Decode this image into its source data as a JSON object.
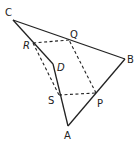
{
  "diagram": {
    "type": "geometry-quadrilateral",
    "vertices": {
      "A": {
        "label": "A",
        "x": 68,
        "y": 126
      },
      "B": {
        "label": "B",
        "x": 125,
        "y": 59
      },
      "C": {
        "label": "C",
        "x": 13,
        "y": 20
      },
      "D": {
        "label": "D",
        "x": 53,
        "y": 64
      }
    },
    "midpoints": {
      "P": {
        "label": "P",
        "x": 96,
        "y": 93
      },
      "Q": {
        "label": "Q",
        "x": 69,
        "y": 40
      },
      "R": {
        "label": "R",
        "x": 33,
        "y": 43
      },
      "S": {
        "label": "S",
        "x": 59,
        "y": 95
      }
    },
    "solid_edges": [
      [
        "A",
        "B"
      ],
      [
        "B",
        "C"
      ],
      [
        "C",
        "D"
      ],
      [
        "D",
        "A"
      ]
    ],
    "dashed_edges": [
      [
        "P",
        "Q"
      ],
      [
        "Q",
        "R"
      ],
      [
        "R",
        "S"
      ],
      [
        "S",
        "P"
      ]
    ],
    "colors": {
      "stroke": "#222222",
      "background": "#ffffff"
    }
  }
}
